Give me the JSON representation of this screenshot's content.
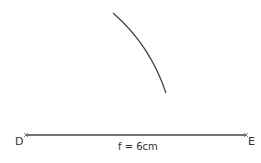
{
  "points": {
    "D": "D",
    "E": "E"
  },
  "segment_label": "f = 6cm",
  "colors": {
    "stroke": "#444444",
    "text": "#333333"
  }
}
